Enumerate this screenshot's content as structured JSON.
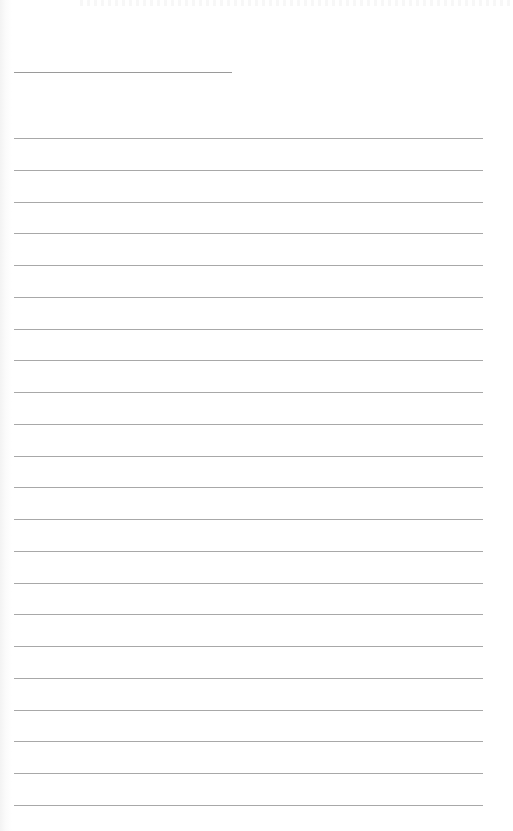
{
  "document": {
    "type": "blank lined page",
    "text": "",
    "header_line": {
      "x": 14,
      "y": 72,
      "width": 218
    },
    "ruled_lines": {
      "count": 22,
      "x": 14,
      "width": 469,
      "first_y": 138,
      "spacing": 31.75
    },
    "colors": {
      "paper": "#ffffff",
      "rule": "#a8a8a8",
      "header_rule": "#9a9a9a"
    }
  }
}
